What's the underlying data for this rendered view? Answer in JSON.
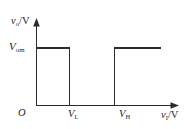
{
  "figure": {
    "kind": "transfer-characteristic",
    "background_color": "#ffffff",
    "line_color": "#2b2b2b",
    "text_color": "#1d1d1d"
  },
  "labels": {
    "y_axis": "v",
    "y_axis_sub": "o",
    "y_axis_unit": "/V",
    "x_axis": "v",
    "x_axis_sub": "I",
    "x_axis_unit": "/V",
    "origin": "O",
    "y_level": "V",
    "y_level_sub": "om",
    "x_tick_low": "V",
    "x_tick_low_sub": "L",
    "x_tick_high": "V",
    "x_tick_high_sub": "H"
  },
  "chart_data": {
    "type": "line",
    "title": "",
    "xlabel": "v_I/V",
    "ylabel": "v_o/V",
    "grid": false,
    "legend": "none",
    "x_ticks": [
      "O",
      "V_L",
      "V_H"
    ],
    "y_ticks": [
      "V_om"
    ],
    "xlim": [
      0,
      1
    ],
    "ylim": [
      0,
      1
    ],
    "annotations": [
      "output high for v_I < V_L",
      "output low for V_L < v_I < V_H",
      "output high for v_I > V_H"
    ],
    "series": [
      {
        "name": "v_o",
        "x": [
          0.0,
          0.265,
          0.265,
          0.625,
          0.625,
          1.0
        ],
        "y": [
          1.0,
          1.0,
          0.0,
          0.0,
          1.0,
          1.0
        ]
      }
    ],
    "markers": {
      "V_L": 0.265,
      "V_H": 0.625,
      "V_om": 1.0
    }
  }
}
